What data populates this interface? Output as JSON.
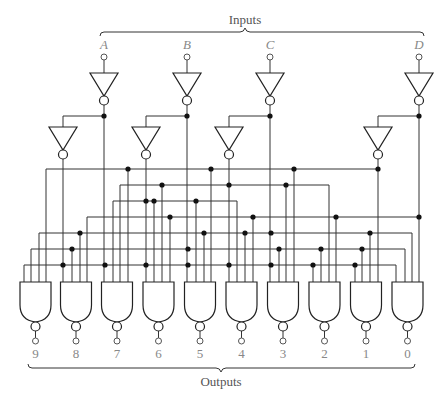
{
  "diagram": {
    "type": "BCD-to-decimal decoder logic circuit",
    "inputs_title": "Inputs",
    "outputs_title": "Outputs",
    "colors": {
      "wire": "#333333",
      "label": "#888888",
      "title": "#555555"
    },
    "inputs": [
      {
        "label": "A",
        "x": 104,
        "inv_x": 63
      },
      {
        "label": "B",
        "x": 187,
        "inv_x": 146
      },
      {
        "label": "C",
        "x": 270,
        "inv_x": 229
      },
      {
        "label": "D",
        "x": 419,
        "inv_x": 378
      }
    ],
    "outputs": [
      {
        "label": "9",
        "cx": 35.5
      },
      {
        "label": "8",
        "cx": 76
      },
      {
        "label": "7",
        "cx": 117
      },
      {
        "label": "6",
        "cx": 158.5
      },
      {
        "label": "5",
        "cx": 200
      },
      {
        "label": "4",
        "cx": 241.5
      },
      {
        "label": "3",
        "cx": 283
      },
      {
        "label": "2",
        "cx": 324.5
      },
      {
        "label": "1",
        "cx": 366
      },
      {
        "label": "0",
        "cx": 407.5
      }
    ],
    "buses": [
      {
        "y": 169,
        "x1": 46,
        "x2": 378
      },
      {
        "y": 185,
        "x1": 120,
        "x2": 329
      },
      {
        "y": 201,
        "x1": 113,
        "x2": 237
      },
      {
        "y": 217,
        "x1": 87,
        "x2": 419
      },
      {
        "y": 233,
        "x1": 39,
        "x2": 412
      },
      {
        "y": 249,
        "x1": 31,
        "x2": 405
      },
      {
        "y": 265,
        "x1": 24,
        "x2": 396
      }
    ],
    "drops": [
      {
        "x": 24,
        "y": 265
      },
      {
        "x": 31,
        "y": 249
      },
      {
        "x": 39,
        "y": 233
      },
      {
        "x": 46,
        "y": 169
      },
      {
        "x": 72,
        "y": 249
      },
      {
        "x": 80,
        "y": 233
      },
      {
        "x": 87,
        "y": 217
      },
      {
        "x": 113,
        "y": 201
      },
      {
        "x": 120,
        "y": 185
      },
      {
        "x": 128,
        "y": 169
      },
      {
        "x": 154,
        "y": 201
      },
      {
        "x": 162,
        "y": 185
      },
      {
        "x": 170,
        "y": 217
      },
      {
        "x": 196,
        "y": 201
      },
      {
        "x": 204,
        "y": 233
      },
      {
        "x": 211,
        "y": 169
      },
      {
        "x": 237,
        "y": 201
      },
      {
        "x": 245,
        "y": 233
      },
      {
        "x": 253,
        "y": 217
      },
      {
        "x": 279,
        "y": 249
      },
      {
        "x": 286,
        "y": 185
      },
      {
        "x": 294,
        "y": 169
      },
      {
        "x": 313,
        "y": 265
      },
      {
        "x": 321,
        "y": 249
      },
      {
        "x": 329,
        "y": 185
      },
      {
        "x": 336,
        "y": 217
      },
      {
        "x": 355,
        "y": 265
      },
      {
        "x": 362,
        "y": 249
      },
      {
        "x": 370,
        "y": 233
      },
      {
        "x": 396,
        "y": 265
      },
      {
        "x": 405,
        "y": 249
      },
      {
        "x": 412,
        "y": 233
      }
    ],
    "junctions": [
      [
        104,
        116
      ],
      [
        187,
        116
      ],
      [
        270,
        116
      ],
      [
        419,
        116
      ],
      [
        128,
        169
      ],
      [
        211,
        169
      ],
      [
        294,
        169
      ],
      [
        378,
        169
      ],
      [
        162,
        185
      ],
      [
        229,
        185
      ],
      [
        286,
        185
      ],
      [
        146,
        201
      ],
      [
        154,
        201
      ],
      [
        196,
        201
      ],
      [
        170,
        217
      ],
      [
        253,
        217
      ],
      [
        336,
        217
      ],
      [
        419,
        217
      ],
      [
        80,
        233
      ],
      [
        204,
        233
      ],
      [
        245,
        233
      ],
      [
        271,
        233
      ],
      [
        370,
        233
      ],
      [
        72,
        249
      ],
      [
        188,
        249
      ],
      [
        279,
        249
      ],
      [
        321,
        249
      ],
      [
        362,
        249
      ],
      [
        63,
        265
      ],
      [
        105,
        265
      ],
      [
        146,
        265
      ],
      [
        188,
        265
      ],
      [
        229,
        265
      ],
      [
        271,
        265
      ],
      [
        313,
        265
      ],
      [
        355,
        265
      ]
    ]
  }
}
